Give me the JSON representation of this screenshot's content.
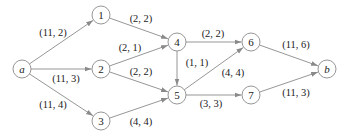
{
  "diagram": {
    "type": "flow-network",
    "colors": {
      "stroke": "#8a8a8a",
      "text": "#222222",
      "background": "#ffffff"
    },
    "nodes": [
      {
        "id": "a",
        "label": "a",
        "x": 22,
        "y": 69,
        "italic": true
      },
      {
        "id": "1",
        "label": "1",
        "x": 101,
        "y": 15,
        "italic": false
      },
      {
        "id": "2",
        "label": "2",
        "x": 101,
        "y": 69,
        "italic": false
      },
      {
        "id": "3",
        "label": "3",
        "x": 101,
        "y": 121,
        "italic": false
      },
      {
        "id": "4",
        "label": "4",
        "x": 177,
        "y": 42,
        "italic": false
      },
      {
        "id": "5",
        "label": "5",
        "x": 177,
        "y": 95,
        "italic": false
      },
      {
        "id": "6",
        "label": "6",
        "x": 251,
        "y": 42,
        "italic": false
      },
      {
        "id": "7",
        "label": "7",
        "x": 251,
        "y": 95,
        "italic": false
      },
      {
        "id": "b",
        "label": "b",
        "x": 327,
        "y": 69,
        "italic": true
      }
    ],
    "edges": [
      {
        "from": "a",
        "to": "1",
        "label": "(11, 2)",
        "lx": 53,
        "ly": 36
      },
      {
        "from": "a",
        "to": "2",
        "label": "(11, 3)",
        "lx": 66,
        "ly": 82
      },
      {
        "from": "a",
        "to": "3",
        "label": "(11, 4)",
        "lx": 53,
        "ly": 108
      },
      {
        "from": "1",
        "to": "4",
        "label": "(2, 2)",
        "lx": 141,
        "ly": 22
      },
      {
        "from": "2",
        "to": "4",
        "label": "(2, 1)",
        "lx": 130,
        "ly": 51
      },
      {
        "from": "2",
        "to": "5",
        "label": "(2, 2)",
        "lx": 141,
        "ly": 75
      },
      {
        "from": "3",
        "to": "5",
        "label": "(4, 4)",
        "lx": 141,
        "ly": 125
      },
      {
        "from": "4",
        "to": "6",
        "label": "(2, 2)",
        "lx": 213,
        "ly": 37
      },
      {
        "from": "4",
        "to": "5",
        "label": "(1, 1)",
        "lx": 197,
        "ly": 66
      },
      {
        "from": "5",
        "to": "6",
        "label": "(4, 4)",
        "lx": 233,
        "ly": 76
      },
      {
        "from": "5",
        "to": "7",
        "label": "(3, 3)",
        "lx": 211,
        "ly": 107
      },
      {
        "from": "6",
        "to": "b",
        "label": "(11, 6)",
        "lx": 296,
        "ly": 48
      },
      {
        "from": "7",
        "to": "b",
        "label": "(11, 3)",
        "lx": 296,
        "ly": 96
      }
    ],
    "node_radius": 9
  }
}
